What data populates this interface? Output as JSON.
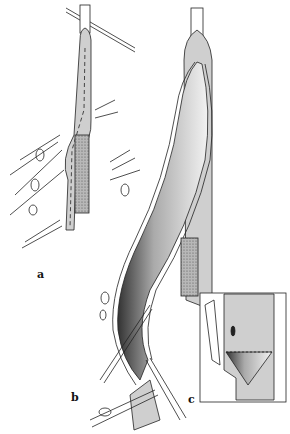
{
  "figure": {
    "panels": [
      {
        "id": "a",
        "label": "a",
        "description": "Vessel with dashed incision line and graft strip"
      },
      {
        "id": "b",
        "label": "b",
        "description": "Opened vessel showing endarterectomy with instruments"
      },
      {
        "id": "c",
        "label": "c",
        "description": "Inset detail of distal end with tacking sutures"
      }
    ],
    "colors": {
      "vessel_fill": "#cfcfcf",
      "line": "#222222",
      "background": "#ffffff",
      "graft_fill": "#9a9a9a"
    }
  }
}
